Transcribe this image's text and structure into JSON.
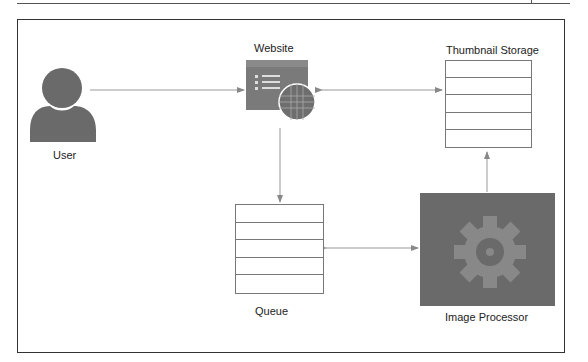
{
  "diagram": {
    "nodes": {
      "user": {
        "label": "User",
        "icon": "user-icon"
      },
      "website": {
        "label": "Website",
        "icon": "website-globe-icon"
      },
      "thumbnail_storage": {
        "label": "Thumbnail Storage",
        "icon": "storage-stack-icon",
        "rows": 5
      },
      "queue": {
        "label": "Queue",
        "icon": "queue-stack-icon",
        "rows": 5
      },
      "image_processor": {
        "label": "Image Processor",
        "icon": "gear-icon"
      }
    },
    "edges": [
      {
        "from": "user",
        "to": "website",
        "direction": "one-way"
      },
      {
        "from": "website",
        "to": "thumbnail_storage",
        "direction": "two-way"
      },
      {
        "from": "website",
        "to": "queue",
        "direction": "one-way"
      },
      {
        "from": "queue",
        "to": "image_processor",
        "direction": "two-way"
      },
      {
        "from": "image_processor",
        "to": "thumbnail_storage",
        "direction": "one-way"
      }
    ],
    "colors": {
      "icon_fill": "#6a6a6a",
      "line": "#999999",
      "frame": "#333333"
    }
  }
}
